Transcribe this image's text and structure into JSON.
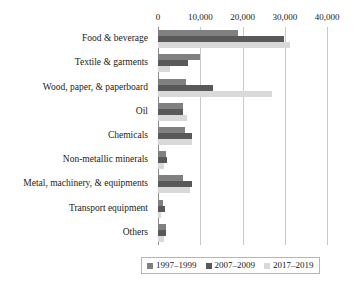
{
  "chart_data": {
    "type": "bar",
    "orientation": "horizontal",
    "title": "",
    "subtitle": "",
    "xlabel": "",
    "ylabel": "",
    "xlim": [
      0,
      40000
    ],
    "grid": true,
    "grid_axis": "x",
    "axis_position": "top",
    "legend_position": "bottom-center",
    "xticks": [
      0,
      10000,
      20000,
      30000,
      40000
    ],
    "xtick_labels": [
      "0",
      "10,000",
      "20,000",
      "30,000",
      "40,000"
    ],
    "categories": [
      "Food & beverage",
      "Textile & garments",
      "Wood, paper, & paperboard",
      "Oil",
      "Chemicals",
      "Non-metallic minerals",
      "Metal, machinery, & equipments",
      "Transport equipment",
      "Others"
    ],
    "series": [
      {
        "name": "1997–1999",
        "color": "#808080",
        "values": [
          18900,
          10000,
          6600,
          5900,
          6400,
          1900,
          5900,
          1200,
          1900
        ]
      },
      {
        "name": "2007–2009",
        "color": "#595959",
        "values": [
          29800,
          7100,
          13000,
          5900,
          8100,
          2100,
          8100,
          1700,
          1900
        ]
      },
      {
        "name": "2017–2019",
        "color": "#d9d9d9",
        "values": [
          31200,
          2900,
          27000,
          6900,
          8100,
          1400,
          7600,
          700,
          1400
        ]
      }
    ]
  },
  "legend": {
    "entries": [
      {
        "label": "1997–1999",
        "color": "#808080"
      },
      {
        "label": "2007–2009",
        "color": "#595959"
      },
      {
        "label": "2017–2019",
        "color": "#d9d9d9"
      }
    ]
  }
}
